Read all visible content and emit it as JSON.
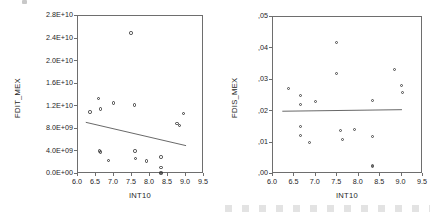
{
  "page": {
    "background_color": "#ffffff",
    "axis_color": "#6e6e6e",
    "marker_color": "#3a3a3a",
    "fitline_color": "#555555"
  },
  "chart_data": [
    {
      "type": "scatter",
      "title": "",
      "xlabel": "INT10",
      "ylabel": "FDIT_MEX",
      "xlim": [
        6.0,
        9.5
      ],
      "ylim": [
        0.0,
        28000000000
      ],
      "xticks": [
        "6.0",
        "6.5",
        "7.0",
        "7.5",
        "8.0",
        "8.5",
        "9.0",
        "9.5"
      ],
      "xtick_values": [
        6.0,
        6.5,
        7.0,
        7.5,
        8.0,
        8.5,
        9.0,
        9.5
      ],
      "yticks": [
        "0.0E+00",
        "4.0E+09",
        "8.0E+09",
        "1.2E+10",
        "1.6E+10",
        "2.0E+10",
        "2.4E+10",
        "2.8E+10"
      ],
      "ytick_values": [
        0,
        4000000000,
        8000000000,
        12000000000,
        16000000000,
        20000000000,
        24000000000,
        28000000000
      ],
      "grid": false,
      "legend": "none",
      "points": [
        {
          "x": 6.33,
          "y": 11000000000
        },
        {
          "x": 6.57,
          "y": 13400000000
        },
        {
          "x": 6.63,
          "y": 11500000000
        },
        {
          "x": 6.98,
          "y": 12600000000
        },
        {
          "x": 7.47,
          "y": 25000000000
        },
        {
          "x": 7.57,
          "y": 12200000000
        },
        {
          "x": 8.75,
          "y": 9000000000
        },
        {
          "x": 8.82,
          "y": 8600000000
        },
        {
          "x": 8.93,
          "y": 10700000000
        },
        {
          "x": 6.6,
          "y": 4050000000
        },
        {
          "x": 6.62,
          "y": 3900000000
        },
        {
          "x": 6.85,
          "y": 2400000000
        },
        {
          "x": 7.58,
          "y": 4100000000
        },
        {
          "x": 7.6,
          "y": 2700000000
        },
        {
          "x": 7.9,
          "y": 2300000000
        },
        {
          "x": 8.3,
          "y": 3000000000
        },
        {
          "x": 8.3,
          "y": 1200000000
        },
        {
          "x": 8.3,
          "y": 300000000
        },
        {
          "x": 8.3,
          "y": 120000000
        }
      ],
      "fit": {
        "x0": 6.22,
        "y0": 8900000000,
        "x1": 9.05,
        "y1": 4700000000
      }
    },
    {
      "type": "scatter",
      "title": "",
      "xlabel": "INT10",
      "ylabel": "FDIS_MEX",
      "xlim": [
        6.0,
        9.5
      ],
      "ylim": [
        0.0,
        0.05
      ],
      "xticks": [
        "6.0",
        "6.5",
        "7.0",
        "7.5",
        "8.0",
        "8.5",
        "9.0",
        "9.5"
      ],
      "xtick_values": [
        6.0,
        6.5,
        7.0,
        7.5,
        8.0,
        8.5,
        9.0,
        9.5
      ],
      "yticks": [
        ",00",
        ",01",
        ",02",
        ",03",
        ",04",
        ",05"
      ],
      "ytick_values": [
        0.0,
        0.01,
        0.02,
        0.03,
        0.04,
        0.05
      ],
      "grid": false,
      "legend": "none",
      "points": [
        {
          "x": 6.36,
          "y": 0.0272
        },
        {
          "x": 6.64,
          "y": 0.025
        },
        {
          "x": 6.63,
          "y": 0.0221
        },
        {
          "x": 6.98,
          "y": 0.0231
        },
        {
          "x": 7.47,
          "y": 0.042
        },
        {
          "x": 7.48,
          "y": 0.032
        },
        {
          "x": 8.33,
          "y": 0.0234
        },
        {
          "x": 8.83,
          "y": 0.0334
        },
        {
          "x": 9.0,
          "y": 0.0281
        },
        {
          "x": 9.02,
          "y": 0.0261
        },
        {
          "x": 6.63,
          "y": 0.0152
        },
        {
          "x": 6.63,
          "y": 0.0122
        },
        {
          "x": 6.86,
          "y": 0.01
        },
        {
          "x": 7.58,
          "y": 0.0137
        },
        {
          "x": 7.63,
          "y": 0.011
        },
        {
          "x": 7.9,
          "y": 0.0142
        },
        {
          "x": 8.33,
          "y": 0.0119
        },
        {
          "x": 8.33,
          "y": 0.0028
        },
        {
          "x": 8.33,
          "y": 0.0023
        }
      ],
      "fit": {
        "x0": 6.22,
        "y0": 0.0196,
        "x1": 9.05,
        "y1": 0.0201
      }
    }
  ]
}
